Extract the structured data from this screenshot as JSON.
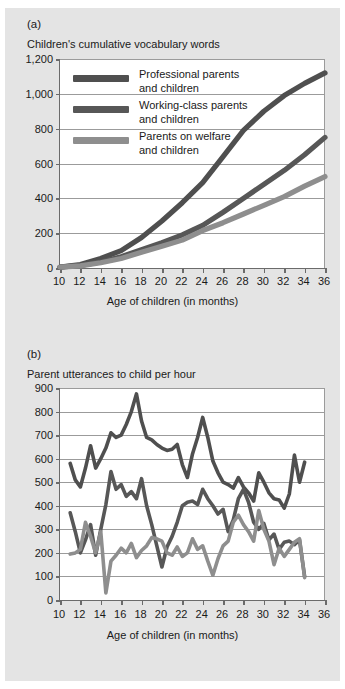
{
  "figure": {
    "background_color": "#e4e4e4",
    "plot_background_color": "#ffffff",
    "axis_color": "#6b6b6b",
    "grid_color": "#9b9b9b"
  },
  "series_colors": {
    "professional": "#4f4f4f",
    "working_class": "#575757",
    "welfare": "#8e8e8e"
  },
  "panel_a": {
    "letter": "(a)",
    "title": "Children's cumulative vocabulary words",
    "xlabel": "Age of children (in months)",
    "legend": [
      {
        "label_line1": "Professional parents",
        "label_line2": "and children",
        "color": "#4f4f4f"
      },
      {
        "label_line1": "Working-class parents",
        "label_line2": "and children",
        "color": "#575757"
      },
      {
        "label_line1": "Parents on welfare",
        "label_line2": "and children",
        "color": "#8e8e8e"
      }
    ]
  },
  "panel_b": {
    "letter": "(b)",
    "title": "Parent utterances to child per hour",
    "xlabel": "Age of children (in months)"
  },
  "chart_data": [
    {
      "id": "panel-a",
      "type": "line",
      "title": "Children's cumulative vocabulary words",
      "xlabel": "Age of children (in months)",
      "ylabel": "",
      "xlim": [
        10,
        36
      ],
      "ylim": [
        0,
        1200
      ],
      "xticks": [
        10,
        12,
        14,
        16,
        18,
        20,
        22,
        24,
        26,
        28,
        30,
        32,
        34,
        36
      ],
      "xticklabels": [
        "10",
        "12",
        "14",
        "16",
        "18",
        "20",
        "22",
        "24",
        "26",
        "28",
        "30",
        "32",
        "34",
        "36"
      ],
      "yticks": [
        0,
        200,
        400,
        600,
        800,
        1000,
        1200
      ],
      "yticklabels": [
        "0",
        "200",
        "400",
        "600",
        "800",
        "1,000",
        "1,200"
      ],
      "grid": true,
      "legend_position": "upper-left-inside",
      "x": [
        10,
        12,
        14,
        16,
        18,
        20,
        22,
        24,
        26,
        28,
        30,
        32,
        34,
        36
      ],
      "series": [
        {
          "name": "Professional parents and children",
          "color": "#4f4f4f",
          "values": [
            5,
            20,
            55,
            100,
            175,
            270,
            375,
            490,
            640,
            790,
            900,
            990,
            1060,
            1120
          ]
        },
        {
          "name": "Working-class parents and children",
          "color": "#575757",
          "values": [
            5,
            15,
            35,
            65,
            105,
            145,
            190,
            245,
            320,
            400,
            480,
            560,
            650,
            750
          ]
        },
        {
          "name": "Parents on welfare and children",
          "color": "#8e8e8e",
          "values": [
            5,
            12,
            30,
            55,
            90,
            125,
            160,
            215,
            260,
            310,
            360,
            410,
            470,
            525
          ]
        }
      ]
    },
    {
      "id": "panel-b",
      "type": "line",
      "title": "Parent utterances to child per hour",
      "xlabel": "Age of children (in months)",
      "ylabel": "",
      "xlim": [
        10,
        36
      ],
      "ylim": [
        0,
        900
      ],
      "xticks": [
        10,
        12,
        14,
        16,
        18,
        20,
        22,
        24,
        26,
        28,
        30,
        32,
        34,
        36
      ],
      "xticklabels": [
        "10",
        "12",
        "14",
        "16",
        "18",
        "20",
        "22",
        "24",
        "26",
        "28",
        "30",
        "32",
        "34",
        "36"
      ],
      "yticks": [
        0,
        100,
        200,
        300,
        400,
        500,
        600,
        700,
        800,
        900
      ],
      "yticklabels": [
        "0",
        "100",
        "200",
        "300",
        "400",
        "500",
        "600",
        "700",
        "800",
        "900"
      ],
      "grid": true,
      "legend_position": "none",
      "x": [
        11,
        11.5,
        12,
        12.5,
        13,
        13.5,
        14,
        14.5,
        15,
        15.5,
        16,
        16.5,
        17,
        17.5,
        18,
        18.5,
        19,
        19.5,
        20,
        20.5,
        21,
        21.5,
        22,
        22.5,
        23,
        23.5,
        24,
        24.5,
        25,
        25.5,
        26,
        26.5,
        27,
        27.5,
        28,
        28.5,
        29,
        29.5,
        30,
        30.5,
        31,
        31.5,
        32,
        32.5,
        33,
        33.5,
        34
      ],
      "series": [
        {
          "name": "Professional parents",
          "color": "#4f4f4f",
          "values": [
            580,
            510,
            480,
            560,
            655,
            560,
            600,
            645,
            710,
            690,
            700,
            745,
            800,
            875,
            760,
            690,
            680,
            660,
            645,
            635,
            640,
            660,
            575,
            520,
            620,
            690,
            775,
            690,
            590,
            540,
            500,
            490,
            475,
            520,
            480,
            455,
            420,
            540,
            500,
            455,
            430,
            425,
            390,
            450,
            615,
            500,
            585
          ]
        },
        {
          "name": "Working-class parents",
          "color": "#575757",
          "values": [
            370,
            290,
            200,
            255,
            320,
            190,
            300,
            405,
            545,
            470,
            490,
            440,
            460,
            430,
            515,
            400,
            320,
            230,
            140,
            225,
            270,
            330,
            400,
            415,
            420,
            405,
            470,
            430,
            400,
            365,
            385,
            290,
            340,
            430,
            470,
            415,
            330,
            300,
            325,
            255,
            280,
            215,
            245,
            250,
            235,
            255,
            100
          ]
        },
        {
          "name": "Parents on welfare",
          "color": "#8e8e8e",
          "values": [
            195,
            200,
            215,
            330,
            270,
            200,
            290,
            30,
            165,
            190,
            220,
            200,
            240,
            180,
            210,
            230,
            265,
            260,
            250,
            200,
            190,
            225,
            185,
            200,
            260,
            215,
            230,
            165,
            105,
            175,
            230,
            250,
            330,
            360,
            320,
            290,
            250,
            380,
            300,
            250,
            150,
            220,
            185,
            215,
            245,
            260,
            95
          ]
        }
      ]
    }
  ]
}
